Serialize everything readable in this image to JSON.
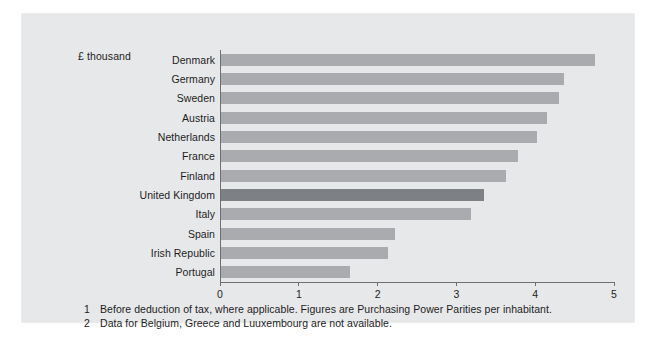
{
  "chart_data": {
    "type": "bar",
    "orientation": "horizontal",
    "title": "",
    "unit_caption": "£ thousand",
    "xlabel": "",
    "ylabel": "",
    "xlim": [
      0,
      5
    ],
    "xticks": [
      0,
      1,
      2,
      3,
      4,
      5
    ],
    "xtick_labels": [
      "0",
      "1",
      "2",
      "3",
      "4",
      "5"
    ],
    "grid": false,
    "legend": null,
    "categories": [
      "Denmark",
      "Germany",
      "Sweden",
      "Austria",
      "Netherlands",
      "France",
      "Finland",
      "United Kingdom",
      "Italy",
      "Spain",
      "Irish Republic",
      "Portugal"
    ],
    "values": [
      4.76,
      4.37,
      4.3,
      4.15,
      4.02,
      3.78,
      3.62,
      3.35,
      3.18,
      2.21,
      2.12,
      1.64
    ],
    "highlight_category": "United Kingdom",
    "colors": {
      "bar": "#a9abae",
      "bar_highlight": "#7d8084",
      "panel_background": "#e7e8ea",
      "page_background": "#ffffff",
      "axis": "#6e7074",
      "text": "#1d1d1d"
    }
  },
  "footnotes": [
    {
      "number": "1",
      "text": "Before deduction of tax, where applicable. Figures are Purchasing Power Parities per inhabitant."
    },
    {
      "number": "2",
      "text": "Data for Belgium, Greece and Luuxembourg are not available."
    }
  ],
  "bottom_caption": ""
}
